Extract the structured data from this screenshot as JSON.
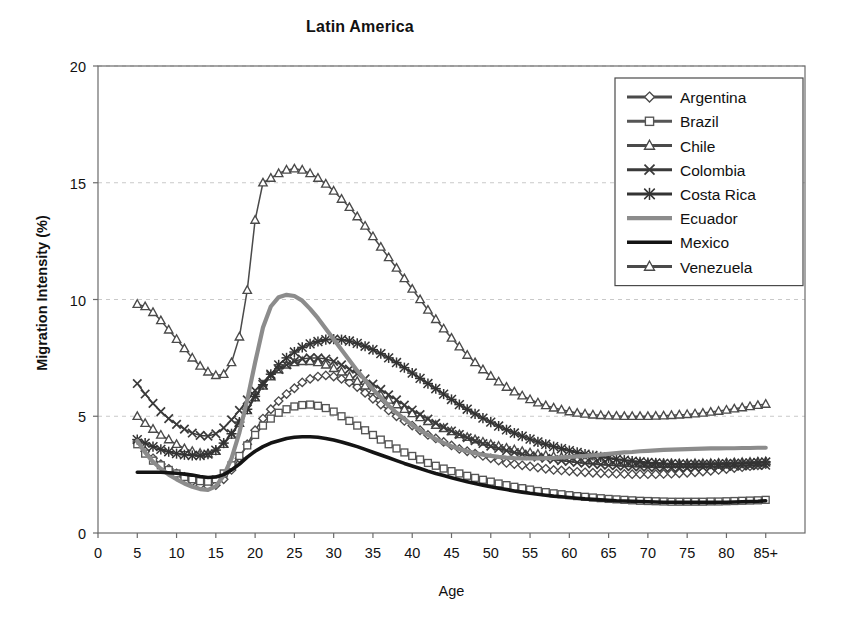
{
  "chart_data": {
    "type": "line",
    "title": "Latin America",
    "xlabel": "Age",
    "ylabel": "Migration Intensity (%)",
    "xlim": [
      0,
      90
    ],
    "ylim": [
      0,
      20
    ],
    "xticks": [
      "0",
      "5",
      "10",
      "15",
      "20",
      "25",
      "30",
      "35",
      "40",
      "45",
      "50",
      "55",
      "60",
      "65",
      "70",
      "75",
      "80",
      "85+"
    ],
    "xtick_values": [
      0,
      5,
      10,
      15,
      20,
      25,
      30,
      35,
      40,
      45,
      50,
      55,
      60,
      65,
      70,
      75,
      80,
      85
    ],
    "yticks": [
      "0",
      "5",
      "10",
      "15",
      "20"
    ],
    "ytick_values": [
      0,
      5,
      10,
      15,
      20
    ],
    "grid": "horizontal-dashed-light",
    "legend_position": "top-right-inside",
    "x": [
      5,
      6,
      7,
      8,
      9,
      10,
      11,
      12,
      13,
      14,
      15,
      16,
      17,
      18,
      19,
      20,
      21,
      22,
      23,
      24,
      25,
      26,
      27,
      28,
      29,
      30,
      31,
      32,
      33,
      34,
      35,
      36,
      37,
      38,
      39,
      40,
      41,
      42,
      43,
      44,
      45,
      46,
      47,
      48,
      49,
      50,
      51,
      52,
      53,
      54,
      55,
      56,
      57,
      58,
      59,
      60,
      61,
      62,
      63,
      64,
      65,
      66,
      67,
      68,
      69,
      70,
      71,
      72,
      73,
      74,
      75,
      76,
      77,
      78,
      79,
      80,
      81,
      82,
      83,
      84,
      85
    ],
    "series": [
      {
        "name": "Argentina",
        "marker": "diamond",
        "color": "#4a4a4a",
        "values": [
          3.9,
          3.5,
          3.2,
          2.95,
          2.75,
          2.55,
          2.4,
          2.2,
          2.05,
          2.0,
          2.05,
          2.3,
          2.7,
          3.2,
          3.8,
          4.4,
          4.9,
          5.3,
          5.65,
          5.95,
          6.2,
          6.45,
          6.6,
          6.7,
          6.75,
          6.7,
          6.6,
          6.45,
          6.25,
          6.0,
          5.75,
          5.5,
          5.25,
          5.0,
          4.8,
          4.6,
          4.4,
          4.2,
          4.05,
          3.9,
          3.75,
          3.6,
          3.5,
          3.4,
          3.3,
          3.2,
          3.1,
          3.0,
          2.95,
          2.9,
          2.85,
          2.8,
          2.75,
          2.7,
          2.68,
          2.65,
          2.62,
          2.6,
          2.58,
          2.56,
          2.55,
          2.54,
          2.53,
          2.52,
          2.52,
          2.52,
          2.52,
          2.53,
          2.54,
          2.56,
          2.58,
          2.6,
          2.63,
          2.66,
          2.7,
          2.74,
          2.78,
          2.82,
          2.86,
          2.9,
          2.95
        ]
      },
      {
        "name": "Brazil",
        "marker": "square",
        "color": "#555555",
        "values": [
          3.8,
          3.4,
          3.1,
          2.9,
          2.7,
          2.55,
          2.4,
          2.3,
          2.22,
          2.2,
          2.3,
          2.55,
          2.9,
          3.3,
          3.75,
          4.2,
          4.6,
          4.9,
          5.15,
          5.3,
          5.42,
          5.48,
          5.5,
          5.45,
          5.35,
          5.2,
          5.0,
          4.8,
          4.6,
          4.4,
          4.2,
          4.0,
          3.8,
          3.62,
          3.45,
          3.3,
          3.15,
          3.0,
          2.88,
          2.76,
          2.65,
          2.55,
          2.45,
          2.36,
          2.28,
          2.2,
          2.12,
          2.05,
          1.98,
          1.92,
          1.86,
          1.8,
          1.75,
          1.7,
          1.66,
          1.62,
          1.58,
          1.55,
          1.52,
          1.49,
          1.46,
          1.44,
          1.42,
          1.4,
          1.38,
          1.37,
          1.36,
          1.35,
          1.34,
          1.34,
          1.34,
          1.34,
          1.34,
          1.35,
          1.35,
          1.36,
          1.37,
          1.38,
          1.39,
          1.4,
          1.42
        ]
      },
      {
        "name": "Chile",
        "marker": "triangle",
        "color": "#4a4a4a",
        "values": [
          5.0,
          4.7,
          4.45,
          4.2,
          4.0,
          3.8,
          3.62,
          3.5,
          3.42,
          3.4,
          3.5,
          3.8,
          4.2,
          4.7,
          5.25,
          5.8,
          6.3,
          6.7,
          7.0,
          7.2,
          7.3,
          7.35,
          7.35,
          7.3,
          7.2,
          7.05,
          6.9,
          6.7,
          6.5,
          6.3,
          6.1,
          5.9,
          5.7,
          5.5,
          5.3,
          5.12,
          4.95,
          4.78,
          4.62,
          4.48,
          4.35,
          4.22,
          4.1,
          4.0,
          3.9,
          3.8,
          3.72,
          3.64,
          3.57,
          3.5,
          3.44,
          3.38,
          3.33,
          3.28,
          3.24,
          3.2,
          3.16,
          3.13,
          3.1,
          3.07,
          3.05,
          3.03,
          3.01,
          3.0,
          2.99,
          2.98,
          2.97,
          2.97,
          2.97,
          2.97,
          2.97,
          2.98,
          2.98,
          2.99,
          3.0,
          3.01,
          3.02,
          3.03,
          3.04,
          3.05,
          3.06
        ]
      },
      {
        "name": "Colombia",
        "marker": "x",
        "color": "#3a3a3a",
        "values": [
          6.4,
          5.95,
          5.55,
          5.2,
          4.9,
          4.65,
          4.45,
          4.28,
          4.18,
          4.15,
          4.25,
          4.5,
          4.85,
          5.25,
          5.7,
          6.1,
          6.45,
          6.75,
          7.0,
          7.2,
          7.35,
          7.45,
          7.5,
          7.5,
          7.45,
          7.35,
          7.2,
          7.02,
          6.82,
          6.6,
          6.38,
          6.15,
          5.92,
          5.7,
          5.48,
          5.27,
          5.07,
          4.88,
          4.7,
          4.53,
          4.37,
          4.22,
          4.08,
          3.95,
          3.83,
          3.72,
          3.62,
          3.53,
          3.45,
          3.38,
          3.31,
          3.25,
          3.2,
          3.15,
          3.1,
          3.06,
          3.02,
          2.99,
          2.96,
          2.93,
          2.9,
          2.88,
          2.86,
          2.84,
          2.83,
          2.82,
          2.81,
          2.8,
          2.8,
          2.8,
          2.8,
          2.81,
          2.82,
          2.83,
          2.84,
          2.85,
          2.86,
          2.87,
          2.88,
          2.89,
          2.9
        ]
      },
      {
        "name": "Costa Rica",
        "marker": "asterisk",
        "color": "#333333",
        "values": [
          4.0,
          3.85,
          3.7,
          3.58,
          3.48,
          3.4,
          3.35,
          3.32,
          3.32,
          3.38,
          3.55,
          3.85,
          4.25,
          4.75,
          5.3,
          5.85,
          6.35,
          6.8,
          7.2,
          7.5,
          7.75,
          7.95,
          8.1,
          8.2,
          8.28,
          8.3,
          8.28,
          8.22,
          8.12,
          8.0,
          7.85,
          7.68,
          7.5,
          7.3,
          7.08,
          6.85,
          6.62,
          6.4,
          6.18,
          5.95,
          5.72,
          5.5,
          5.3,
          5.1,
          4.92,
          4.75,
          4.58,
          4.42,
          4.28,
          4.15,
          4.02,
          3.9,
          3.8,
          3.7,
          3.61,
          3.53,
          3.45,
          3.38,
          3.32,
          3.26,
          3.21,
          3.16,
          3.12,
          3.08,
          3.05,
          3.02,
          3.0,
          2.98,
          2.97,
          2.96,
          2.95,
          2.95,
          2.95,
          2.95,
          2.96,
          2.97,
          2.98,
          2.99,
          3.0,
          3.02,
          3.04
        ]
      },
      {
        "name": "Ecuador",
        "marker": "none",
        "color": "#8c8c8c",
        "values": [
          3.95,
          3.45,
          3.05,
          2.75,
          2.5,
          2.3,
          2.12,
          1.98,
          1.88,
          1.85,
          2.0,
          2.45,
          3.2,
          4.3,
          5.7,
          7.3,
          8.8,
          9.7,
          10.1,
          10.2,
          10.15,
          9.95,
          9.6,
          9.2,
          8.75,
          8.3,
          7.85,
          7.4,
          6.95,
          6.55,
          6.15,
          5.8,
          5.45,
          5.15,
          4.88,
          4.62,
          4.4,
          4.2,
          4.02,
          3.86,
          3.72,
          3.6,
          3.5,
          3.42,
          3.35,
          3.3,
          3.26,
          3.23,
          3.21,
          3.2,
          3.2,
          3.2,
          3.21,
          3.22,
          3.24,
          3.26,
          3.28,
          3.3,
          3.33,
          3.36,
          3.39,
          3.42,
          3.45,
          3.47,
          3.5,
          3.52,
          3.54,
          3.56,
          3.57,
          3.58,
          3.59,
          3.6,
          3.61,
          3.62,
          3.62,
          3.63,
          3.63,
          3.64,
          3.64,
          3.65,
          3.65
        ]
      },
      {
        "name": "Mexico",
        "marker": "thick-line",
        "color": "#141414",
        "values": [
          2.6,
          2.6,
          2.6,
          2.6,
          2.58,
          2.56,
          2.52,
          2.48,
          2.42,
          2.38,
          2.4,
          2.5,
          2.7,
          2.95,
          3.25,
          3.5,
          3.7,
          3.85,
          3.95,
          4.05,
          4.1,
          4.12,
          4.12,
          4.1,
          4.05,
          3.98,
          3.9,
          3.8,
          3.7,
          3.58,
          3.46,
          3.34,
          3.22,
          3.1,
          2.98,
          2.87,
          2.76,
          2.65,
          2.55,
          2.46,
          2.37,
          2.28,
          2.2,
          2.12,
          2.05,
          1.98,
          1.92,
          1.86,
          1.8,
          1.75,
          1.7,
          1.66,
          1.62,
          1.58,
          1.55,
          1.52,
          1.49,
          1.46,
          1.44,
          1.42,
          1.4,
          1.38,
          1.37,
          1.36,
          1.35,
          1.34,
          1.33,
          1.32,
          1.32,
          1.31,
          1.31,
          1.31,
          1.31,
          1.31,
          1.32,
          1.32,
          1.33,
          1.34,
          1.35,
          1.36,
          1.38
        ]
      },
      {
        "name": "Venezuela",
        "marker": "triangle",
        "color": "#4a4a4a",
        "values": [
          9.8,
          9.7,
          9.45,
          9.1,
          8.7,
          8.3,
          7.9,
          7.5,
          7.15,
          6.9,
          6.75,
          6.8,
          7.3,
          8.4,
          10.4,
          13.4,
          15.0,
          15.2,
          15.4,
          15.55,
          15.6,
          15.55,
          15.4,
          15.2,
          14.95,
          14.65,
          14.3,
          13.95,
          13.55,
          13.15,
          12.7,
          12.25,
          11.8,
          11.35,
          10.9,
          10.45,
          10.0,
          9.55,
          9.15,
          8.75,
          8.35,
          7.98,
          7.62,
          7.3,
          7.0,
          6.72,
          6.48,
          6.25,
          6.05,
          5.88,
          5.72,
          5.58,
          5.46,
          5.36,
          5.28,
          5.2,
          5.14,
          5.1,
          5.06,
          5.04,
          5.02,
          5.01,
          5.0,
          5.0,
          5.0,
          5.0,
          5.01,
          5.02,
          5.04,
          5.06,
          5.08,
          5.11,
          5.14,
          5.18,
          5.22,
          5.27,
          5.32,
          5.37,
          5.42,
          5.47,
          5.52
        ]
      }
    ]
  }
}
